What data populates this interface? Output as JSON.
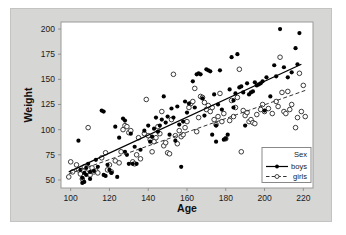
{
  "chart_data": {
    "type": "scatter",
    "title": "",
    "xlabel": "Age",
    "ylabel": "Weight",
    "xlim": [
      95,
      225
    ],
    "ylim": [
      42,
      207
    ],
    "xticks": [
      100,
      120,
      140,
      160,
      180,
      200,
      220
    ],
    "yticks": [
      50,
      75,
      100,
      125,
      150,
      175,
      200
    ],
    "grid": false,
    "legend": {
      "title": "Sex",
      "position": "bottom-right",
      "entries": [
        {
          "name": "boys",
          "marker": "filled-circle",
          "line": "solid",
          "color": "#000000"
        },
        {
          "name": "girls",
          "marker": "open-circle",
          "line": "dashed",
          "color": "#444444"
        }
      ]
    },
    "series": [
      {
        "name": "boys",
        "marker": "filled-circle",
        "color": "#000000",
        "fit_line": {
          "style": "solid",
          "x": [
            99,
            219
          ],
          "y": [
            58,
            165
          ]
        },
        "points": [
          [
            104,
            89
          ],
          [
            105,
            60
          ],
          [
            106,
            52
          ],
          [
            106,
            47
          ],
          [
            107,
            48
          ],
          [
            107,
            57
          ],
          [
            108,
            62
          ],
          [
            108,
            55
          ],
          [
            109,
            66
          ],
          [
            110,
            58
          ],
          [
            110,
            51
          ],
          [
            112,
            59
          ],
          [
            113,
            70
          ],
          [
            114,
            63
          ],
          [
            116,
            119
          ],
          [
            117,
            118
          ],
          [
            117,
            55
          ],
          [
            118,
            54
          ],
          [
            119,
            65
          ],
          [
            120,
            60
          ],
          [
            121,
            57
          ],
          [
            123,
            103
          ],
          [
            124,
            53
          ],
          [
            125,
            92
          ],
          [
            127,
            111
          ],
          [
            128,
            109
          ],
          [
            128,
            78
          ],
          [
            129,
            75
          ],
          [
            130,
            66
          ],
          [
            131,
            96
          ],
          [
            132,
            66
          ],
          [
            133,
            83
          ],
          [
            134,
            66
          ],
          [
            136,
            80
          ],
          [
            138,
            99
          ],
          [
            140,
            104
          ],
          [
            141,
            88
          ],
          [
            142,
            93
          ],
          [
            143,
            101
          ],
          [
            144,
            112
          ],
          [
            145,
            98
          ],
          [
            146,
            104
          ],
          [
            147,
            110
          ],
          [
            148,
            133
          ],
          [
            149,
            107
          ],
          [
            150,
            113
          ],
          [
            151,
            95
          ],
          [
            152,
            121
          ],
          [
            153,
            112
          ],
          [
            154,
            89
          ],
          [
            155,
            123
          ],
          [
            156,
            105
          ],
          [
            157,
            63
          ],
          [
            158,
            108
          ],
          [
            159,
            128
          ],
          [
            160,
            117
          ],
          [
            161,
            126
          ],
          [
            163,
            148
          ],
          [
            164,
            122
          ],
          [
            165,
            155
          ],
          [
            166,
            156
          ],
          [
            167,
            155
          ],
          [
            168,
            131
          ],
          [
            169,
            114
          ],
          [
            170,
            160
          ],
          [
            171,
            159
          ],
          [
            172,
            158
          ],
          [
            173,
            95
          ],
          [
            174,
            135
          ],
          [
            175,
            104
          ],
          [
            175,
            88
          ],
          [
            176,
            125
          ],
          [
            177,
            159
          ],
          [
            178,
            120
          ],
          [
            179,
            90
          ],
          [
            180,
            91
          ],
          [
            181,
            95
          ],
          [
            182,
            140
          ],
          [
            183,
            172
          ],
          [
            184,
            122
          ],
          [
            184,
            129
          ],
          [
            185,
            136
          ],
          [
            186,
            175
          ],
          [
            187,
            142
          ],
          [
            188,
            143
          ],
          [
            189,
            137
          ],
          [
            190,
            104
          ],
          [
            191,
            146
          ],
          [
            192,
            135
          ],
          [
            193,
            137
          ],
          [
            194,
            138
          ],
          [
            195,
            147
          ],
          [
            196,
            144
          ],
          [
            197,
            145
          ],
          [
            198,
            146
          ],
          [
            199,
            148
          ],
          [
            200,
            119
          ],
          [
            201,
            152
          ],
          [
            203,
            133
          ],
          [
            205,
            164
          ],
          [
            206,
            153
          ],
          [
            208,
            200
          ],
          [
            210,
            162
          ],
          [
            212,
            152
          ],
          [
            214,
            157
          ],
          [
            216,
            181
          ],
          [
            217,
            165
          ],
          [
            218,
            196
          ]
        ]
      },
      {
        "name": "girls",
        "marker": "open-circle",
        "color": "#333333",
        "fit_line": {
          "style": "dashed",
          "x": [
            99,
            221
          ],
          "y": [
            56,
            139
          ]
        },
        "points": [
          [
            99,
            53
          ],
          [
            100,
            68
          ],
          [
            101,
            58
          ],
          [
            103,
            65
          ],
          [
            104,
            60
          ],
          [
            105,
            56
          ],
          [
            106,
            51
          ],
          [
            107,
            63
          ],
          [
            108,
            57
          ],
          [
            109,
            102
          ],
          [
            110,
            55
          ],
          [
            111,
            62
          ],
          [
            112,
            58
          ],
          [
            113,
            59
          ],
          [
            114,
            57
          ],
          [
            116,
            72
          ],
          [
            118,
            77
          ],
          [
            119,
            60
          ],
          [
            120,
            65
          ],
          [
            121,
            58
          ],
          [
            123,
            69
          ],
          [
            125,
            67
          ],
          [
            126,
            78
          ],
          [
            127,
            100
          ],
          [
            128,
            104
          ],
          [
            129,
            103
          ],
          [
            130,
            97
          ],
          [
            131,
            99
          ],
          [
            132,
            68
          ],
          [
            133,
            66
          ],
          [
            134,
            75
          ],
          [
            135,
            92
          ],
          [
            136,
            71
          ],
          [
            138,
            96
          ],
          [
            139,
            130
          ],
          [
            140,
            94
          ],
          [
            141,
            90
          ],
          [
            142,
            78
          ],
          [
            143,
            88
          ],
          [
            144,
            92
          ],
          [
            145,
            103
          ],
          [
            146,
            96
          ],
          [
            147,
            118
          ],
          [
            148,
            84
          ],
          [
            149,
            87
          ],
          [
            150,
            77
          ],
          [
            151,
            76
          ],
          [
            152,
            110
          ],
          [
            153,
            155
          ],
          [
            154,
            94
          ],
          [
            155,
            86
          ],
          [
            156,
            99
          ],
          [
            157,
            93
          ],
          [
            158,
            95
          ],
          [
            159,
            102
          ],
          [
            160,
            108
          ],
          [
            161,
            122
          ],
          [
            162,
            126
          ],
          [
            163,
            128
          ],
          [
            164,
            141
          ],
          [
            165,
            98
          ],
          [
            166,
            112
          ],
          [
            167,
            133
          ],
          [
            168,
            132
          ],
          [
            169,
            127
          ],
          [
            170,
            120
          ],
          [
            171,
            124
          ],
          [
            172,
            118
          ],
          [
            173,
            122
          ],
          [
            174,
            110
          ],
          [
            175,
            105
          ],
          [
            176,
            113
          ],
          [
            177,
            136
          ],
          [
            178,
            108
          ],
          [
            179,
            116
          ],
          [
            180,
            91
          ],
          [
            182,
            109
          ],
          [
            183,
            129
          ],
          [
            184,
            113
          ],
          [
            185,
            122
          ],
          [
            186,
            132
          ],
          [
            187,
            160
          ],
          [
            188,
            78
          ],
          [
            189,
            119
          ],
          [
            190,
            114
          ],
          [
            191,
            117
          ],
          [
            192,
            108
          ],
          [
            193,
            110
          ],
          [
            194,
            107
          ],
          [
            195,
            106
          ],
          [
            196,
            115
          ],
          [
            198,
            120
          ],
          [
            199,
            125
          ],
          [
            200,
            118
          ],
          [
            202,
            121
          ],
          [
            204,
            116
          ],
          [
            206,
            128
          ],
          [
            207,
            123
          ],
          [
            208,
            172
          ],
          [
            209,
            137
          ],
          [
            210,
            118
          ],
          [
            211,
            116
          ],
          [
            212,
            138
          ],
          [
            213,
            120
          ],
          [
            214,
            125
          ],
          [
            216,
            102
          ],
          [
            217,
            112
          ],
          [
            218,
            156
          ],
          [
            219,
            118
          ],
          [
            220,
            144
          ],
          [
            221,
            113
          ]
        ]
      }
    ]
  }
}
